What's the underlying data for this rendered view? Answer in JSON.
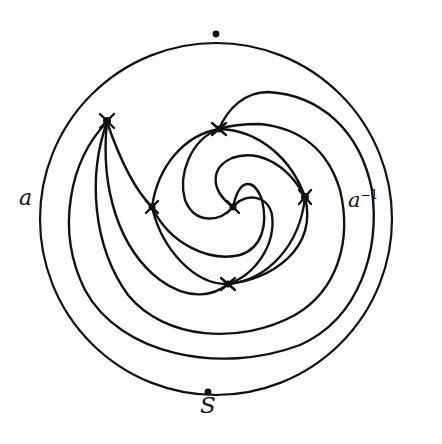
{
  "diagram": {
    "labels": {
      "left": "a",
      "right_base": "a",
      "right_exponent": "−1",
      "bottom": "S"
    },
    "boundary_points": [
      "top",
      "bottom (S)"
    ],
    "vertex_markers": [
      {
        "name": "upper-left",
        "x": 107,
        "y": 120
      },
      {
        "name": "top-center",
        "x": 219,
        "y": 129
      },
      {
        "name": "left-inner",
        "x": 152,
        "y": 207
      },
      {
        "name": "center",
        "x": 233,
        "y": 207
      },
      {
        "name": "right-inner",
        "x": 305,
        "y": 197
      },
      {
        "name": "bottom-center",
        "x": 228,
        "y": 284
      }
    ],
    "colors": {
      "ink": "#111111",
      "background": "#ffffff"
    }
  }
}
